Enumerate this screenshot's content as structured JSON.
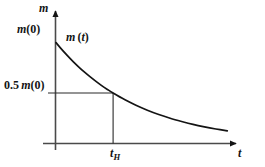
{
  "figure": {
    "name": "radioactive-decay-half-life-diagram",
    "background_color": "#ffffff",
    "line_color": "#141414",
    "axis_color": "#4a4a4a"
  },
  "labels": {
    "y_axis": "m",
    "x_axis": "t",
    "initial_mass": "m(0)",
    "half_mass": "0.5 m(0)",
    "curve": "m (t)",
    "half_life_tick": "tH",
    "half_life_tick_base": "t",
    "half_life_tick_sub": "H"
  },
  "chart_data": {
    "type": "line",
    "title": "",
    "subtitle": "",
    "xlabel": "t",
    "ylabel": "m",
    "grid": false,
    "legend": null,
    "xlim": [
      0,
      3.1
    ],
    "ylim": [
      0,
      1.12
    ],
    "xticks": [
      {
        "value": 1,
        "label": "tH"
      }
    ],
    "yticks": [
      {
        "value": 1.0,
        "label": "m(0)"
      },
      {
        "value": 0.5,
        "label": "0.5 m(0)"
      }
    ],
    "annotations": [
      {
        "text": "m (t)",
        "x": 0.28,
        "y": 0.93,
        "type": "curve-label"
      }
    ],
    "guide_lines": [
      {
        "type": "horizontal",
        "y": 0.5,
        "from_x": 0,
        "to_x": 1,
        "label": "0.5 m(0)"
      },
      {
        "type": "vertical",
        "x": 1,
        "from_y": 0,
        "to_y": 0.5,
        "label": "tH"
      }
    ],
    "series": [
      {
        "name": "m (t)",
        "formula": "m(t) = m(0) * 0.5^(t / tH)",
        "x": [
          0.0,
          0.1,
          0.2,
          0.3,
          0.4,
          0.5,
          0.6,
          0.7,
          0.8,
          0.9,
          1.0,
          1.2,
          1.4,
          1.6,
          1.8,
          2.0,
          2.2,
          2.4,
          2.6,
          2.8,
          3.0
        ],
        "values": [
          1.0,
          0.933,
          0.871,
          0.812,
          0.758,
          0.707,
          0.66,
          0.616,
          0.574,
          0.536,
          0.5,
          0.435,
          0.379,
          0.33,
          0.287,
          0.25,
          0.218,
          0.189,
          0.165,
          0.144,
          0.125
        ]
      }
    ]
  }
}
